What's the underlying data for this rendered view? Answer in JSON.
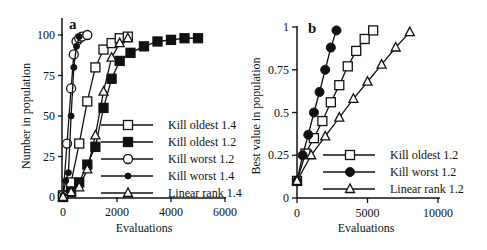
{
  "chart_data": [
    {
      "panel": "a",
      "type": "line",
      "xlabel": "Evaluations",
      "ylabel": "Number in population",
      "xlim": [
        0,
        6000
      ],
      "ylim": [
        0,
        100
      ],
      "xticks": [
        0,
        2000,
        4000,
        6000
      ],
      "yticks": [
        0,
        25,
        50,
        75,
        100
      ],
      "grid": false,
      "legend_position": "lower right",
      "series": [
        {
          "name": "Kill oldest 1.4",
          "marker": "open-square",
          "x": [
            0,
            300,
            600,
            900,
            1200,
            1500,
            1800,
            2100,
            2400
          ],
          "y": [
            1,
            9,
            33,
            59,
            80,
            91,
            95,
            98,
            99
          ]
        },
        {
          "name": "Kill oldest 1.2",
          "marker": "filled-square",
          "x": [
            0,
            300,
            600,
            900,
            1200,
            1500,
            1800,
            2100,
            2500,
            3000,
            3500,
            4000,
            4500,
            5000
          ],
          "y": [
            0,
            3,
            9,
            20,
            31,
            55,
            73,
            84,
            89,
            93,
            96,
            97,
            98,
            98
          ]
        },
        {
          "name": "Kill worst 1.2",
          "marker": "open-circle",
          "x": [
            0,
            150,
            300,
            400,
            500,
            600,
            700,
            900
          ],
          "y": [
            1,
            33,
            67,
            88,
            96,
            98,
            99,
            100
          ]
        },
        {
          "name": "Kill worst 1.4",
          "marker": "filled-circle",
          "x": [
            0,
            100,
            200,
            300,
            400,
            500,
            600
          ],
          "y": [
            1,
            10,
            15,
            50,
            80,
            93,
            99
          ]
        },
        {
          "name": "Linear rank 1.4",
          "marker": "open-triangle",
          "x": [
            0,
            300,
            600,
            900,
            1200,
            1500,
            1800,
            2100,
            2400
          ],
          "y": [
            0,
            3,
            6,
            17,
            38,
            65,
            86,
            95,
            98
          ]
        }
      ]
    },
    {
      "panel": "b",
      "type": "line",
      "xlabel": "Evaluations",
      "ylabel": "Best value in population",
      "xlim": [
        0,
        10000
      ],
      "ylim": [
        0,
        1
      ],
      "xticks": [
        0,
        5000,
        10000
      ],
      "yticks": [
        0,
        0.25,
        0.5,
        0.75,
        1
      ],
      "grid": false,
      "legend_position": "lower right",
      "series": [
        {
          "name": "Kill oldest 1.2",
          "marker": "open-square",
          "x": [
            0,
            600,
            1200,
            1800,
            2400,
            3000,
            3600,
            4200,
            4800,
            5400
          ],
          "y": [
            0.1,
            0.26,
            0.35,
            0.45,
            0.56,
            0.66,
            0.77,
            0.86,
            0.93,
            0.98
          ]
        },
        {
          "name": "Kill worst 1.2",
          "marker": "filled-circle",
          "x": [
            0,
            400,
            800,
            1200,
            1600,
            2000,
            2400,
            2800
          ],
          "y": [
            0.1,
            0.25,
            0.37,
            0.5,
            0.62,
            0.75,
            0.88,
            0.98
          ]
        },
        {
          "name": "Linear rank 1.2",
          "marker": "open-triangle",
          "x": [
            0,
            1000,
            2000,
            3000,
            4000,
            5000,
            6000,
            7000,
            8000
          ],
          "y": [
            0.1,
            0.25,
            0.36,
            0.47,
            0.58,
            0.68,
            0.78,
            0.88,
            0.97
          ]
        }
      ]
    }
  ],
  "labels": {
    "panel_a": "a",
    "panel_b": "b",
    "a_xlabel": "Evaluations",
    "a_ylabel": "Number in population",
    "b_xlabel": "Evaluations",
    "b_ylabel": "Best value in population",
    "a_xticks": [
      "0",
      "2000",
      "4000",
      "6000"
    ],
    "a_yticks": [
      "0",
      "25",
      "50",
      "75",
      "100"
    ],
    "b_xticks": [
      "0",
      "5000",
      "10000"
    ],
    "b_yticks": [
      "0",
      "0.25",
      "0.5",
      "0.75",
      "1"
    ],
    "a_legend": [
      "Kill oldest 1.4",
      "Kill oldest 1.2",
      "Kill worst 1.2",
      "Kill worst 1.4",
      "Linear rank 1.4"
    ],
    "b_legend": [
      "Kill oldest 1.2",
      "Kill worst 1.2",
      "Linear rank 1.2"
    ]
  }
}
